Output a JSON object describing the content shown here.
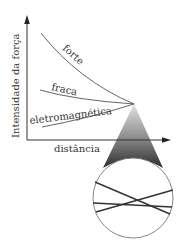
{
  "diagram": {
    "y_axis_label": "Intensidade da força",
    "x_axis_label": "distância",
    "curves": [
      {
        "label": "forte"
      },
      {
        "label": "fraca"
      },
      {
        "label": "eletromagnética"
      }
    ],
    "colors": {
      "ink": "#333333",
      "cone_dark": "#3a3a3a",
      "cone_light": "#d8d8d8"
    }
  }
}
